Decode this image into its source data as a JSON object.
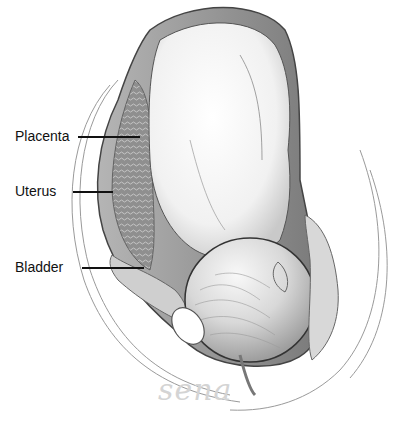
{
  "diagram": {
    "labels": [
      {
        "text": "Placenta",
        "x": 15,
        "y": 128,
        "line_x1": 78,
        "line_x2": 140,
        "line_y": 136
      },
      {
        "text": "Uterus",
        "x": 15,
        "y": 183,
        "line_x1": 73,
        "line_x2": 113,
        "line_y": 191
      },
      {
        "text": "Bladder",
        "x": 15,
        "y": 259,
        "line_x1": 82,
        "line_x2": 144,
        "line_y": 267
      }
    ],
    "signature": "sena",
    "colors": {
      "outline": "#4a4a4a",
      "uterus_wall": "#8c8c8c",
      "placenta": "#9a9a9a",
      "fetus_skin": "#f4f4f4",
      "shadow": "#bdbdbd",
      "hair": "#a8a8a8",
      "label_text": "#111111",
      "signature": "#d4d4d4"
    }
  }
}
